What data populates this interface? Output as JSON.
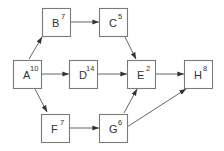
{
  "diagram": {
    "type": "activity-network",
    "box_size": 28,
    "colors": {
      "box_stroke": "#7a7a7a",
      "edge": "#555555",
      "text": "#333333",
      "background": "#ffffff"
    },
    "nodes": [
      {
        "id": "A",
        "label": "A",
        "duration": "10",
        "x": 13,
        "y": 60
      },
      {
        "id": "B",
        "label": "B",
        "duration": "7",
        "x": 42,
        "y": 8
      },
      {
        "id": "C",
        "label": "C",
        "duration": "5",
        "x": 99,
        "y": 8
      },
      {
        "id": "D",
        "label": "D",
        "duration": "14",
        "x": 69,
        "y": 60
      },
      {
        "id": "E",
        "label": "E",
        "duration": "2",
        "x": 127,
        "y": 60
      },
      {
        "id": "F",
        "label": "F",
        "duration": "7",
        "x": 41,
        "y": 114
      },
      {
        "id": "G",
        "label": "G",
        "duration": "6",
        "x": 99,
        "y": 114
      },
      {
        "id": "H",
        "label": "H",
        "duration": "8",
        "x": 184,
        "y": 60
      }
    ],
    "edges": [
      {
        "from": "A",
        "to": "B",
        "x1": 29,
        "y1": 59,
        "x2": 42,
        "y2": 37
      },
      {
        "from": "A",
        "to": "D",
        "x1": 41,
        "y1": 74,
        "x2": 69,
        "y2": 74
      },
      {
        "from": "A",
        "to": "F",
        "x1": 35,
        "y1": 89,
        "x2": 47,
        "y2": 112
      },
      {
        "from": "B",
        "to": "C",
        "x1": 70,
        "y1": 22,
        "x2": 99,
        "y2": 22
      },
      {
        "from": "C",
        "to": "E",
        "x1": 125,
        "y1": 37,
        "x2": 136,
        "y2": 59
      },
      {
        "from": "D",
        "to": "E",
        "x1": 97,
        "y1": 74,
        "x2": 127,
        "y2": 74
      },
      {
        "from": "E",
        "to": "H",
        "x1": 154,
        "y1": 74,
        "x2": 184,
        "y2": 74
      },
      {
        "from": "F",
        "to": "G",
        "x1": 69,
        "y1": 128,
        "x2": 99,
        "y2": 128
      },
      {
        "from": "G",
        "to": "E",
        "x1": 124,
        "y1": 113,
        "x2": 137,
        "y2": 89
      },
      {
        "from": "G",
        "to": "H",
        "x1": 127,
        "y1": 127,
        "x2": 186,
        "y2": 89
      }
    ]
  }
}
